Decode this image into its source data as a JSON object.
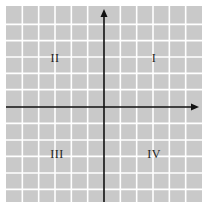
{
  "figure": {
    "type": "coordinate-plane",
    "grid": {
      "columns": 12,
      "rows": 12,
      "cell_color": "#c9c9c9",
      "line_color": "#ffffff"
    },
    "axes": {
      "color": "#111111",
      "x_axis_arrow": "right",
      "y_axis_arrow": "up"
    },
    "quadrants": [
      {
        "id": "I",
        "label": "I"
      },
      {
        "id": "II",
        "label": "II"
      },
      {
        "id": "III",
        "label": "III"
      },
      {
        "id": "IV",
        "label": "IV"
      }
    ]
  }
}
